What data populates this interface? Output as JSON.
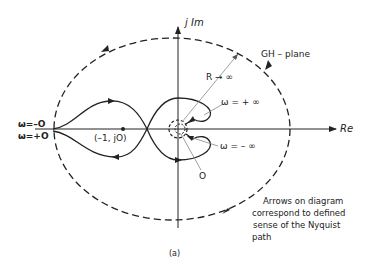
{
  "diagram": {
    "caption": "(a)",
    "plane_label": "GH – plane",
    "axes": {
      "real": "Re",
      "imag": "j Im"
    },
    "labels": {
      "omega_minus_zero": "ω=–O",
      "omega_plus_zero": "ω=+O",
      "critical_point": "(–1, jO)",
      "R_infinity": "R → ∞",
      "omega_plus_inf": "ω = + ∞",
      "omega_minus_inf": "ω = – ∞",
      "origin": "O"
    },
    "note": {
      "line1": "Arrows on diagram",
      "line2": "correspond to defined",
      "line3": "sense of the Nyquist",
      "line4": "path"
    },
    "colors": {
      "ink": "#222222",
      "leader": "#888888",
      "background": "#ffffff"
    }
  }
}
